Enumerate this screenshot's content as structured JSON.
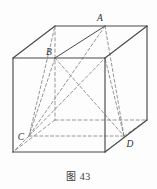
{
  "figure": {
    "caption_label": "图",
    "caption_number": "43",
    "shape": "cube with inscribed tetrahedron",
    "colors": {
      "visible_edge": "#4a4a4a",
      "hidden_edge": "#8d8d8d",
      "label_text": "#2e2e2e",
      "background": "#fdfdfd"
    },
    "vertices": [
      {
        "id": "A",
        "label": "A",
        "x": 105,
        "y": 26,
        "label_x": 101,
        "label_y": 21
      },
      {
        "id": "B",
        "label": "B",
        "x": 55,
        "y": 58,
        "label_x": 50,
        "label_y": 54
      },
      {
        "id": "C",
        "label": "C",
        "x": 29,
        "y": 136,
        "label_x": 20,
        "label_y": 140
      },
      {
        "id": "D",
        "label": "D",
        "x": 124,
        "y": 136,
        "label_x": 127,
        "label_y": 146
      }
    ],
    "cube": {
      "front_face": [
        [
          13,
          58
        ],
        [
          105,
          58
        ],
        [
          105,
          152
        ],
        [
          13,
          152
        ]
      ],
      "back_face": [
        [
          55,
          26
        ],
        [
          147,
          26
        ],
        [
          147,
          120
        ],
        [
          55,
          120
        ]
      ],
      "visible_edges": [
        [
          [
            13,
            58
          ],
          [
            105,
            58
          ]
        ],
        [
          [
            105,
            58
          ],
          [
            105,
            152
          ]
        ],
        [
          [
            105,
            152
          ],
          [
            13,
            152
          ]
        ],
        [
          [
            13,
            152
          ],
          [
            13,
            58
          ]
        ],
        [
          [
            13,
            58
          ],
          [
            55,
            26
          ]
        ],
        [
          [
            55,
            26
          ],
          [
            147,
            26
          ]
        ],
        [
          [
            147,
            26
          ],
          [
            105,
            58
          ]
        ],
        [
          [
            147,
            26
          ],
          [
            147,
            120
          ]
        ],
        [
          [
            147,
            120
          ],
          [
            105,
            152
          ]
        ]
      ],
      "hidden_edges": [
        [
          [
            55,
            26
          ],
          [
            55,
            120
          ]
        ],
        [
          [
            55,
            120
          ],
          [
            147,
            120
          ]
        ],
        [
          [
            55,
            120
          ],
          [
            13,
            152
          ]
        ]
      ]
    },
    "tetrahedron": {
      "name": "ABCD",
      "edges": [
        {
          "from": "A",
          "to": "B",
          "style": "solid"
        },
        {
          "from": "A",
          "to": "C",
          "style": "dashed"
        },
        {
          "from": "A",
          "to": "D",
          "style": "dashed"
        },
        {
          "from": "B",
          "to": "C",
          "style": "dashed"
        },
        {
          "from": "B",
          "to": "D",
          "style": "dashed"
        },
        {
          "from": "C",
          "to": "D",
          "style": "dashed"
        }
      ]
    },
    "construction_lines": [
      {
        "from": [
          29,
          136
        ],
        "to": [
          55,
          26
        ],
        "style": "dashed",
        "note": "C to back-top-left"
      },
      {
        "from": [
          29,
          136
        ],
        "to": [
          105,
          58
        ],
        "style": "dashed",
        "note": "C to front-top-right"
      },
      {
        "from": [
          124,
          136
        ],
        "to": [
          105,
          58
        ],
        "style": "dashed",
        "note": "D to front-top-right"
      },
      {
        "from": [
          124,
          136
        ],
        "to": [
          105,
          26
        ],
        "style": "dashed",
        "note": "D up to A column"
      },
      {
        "from": [
          29,
          136
        ],
        "to": [
          13,
          152
        ],
        "style": "dashed",
        "note": "C to front-bottom-left"
      },
      {
        "from": [
          124,
          136
        ],
        "to": [
          147,
          120
        ],
        "style": "dashed",
        "note": "D to back-bottom-right"
      }
    ]
  }
}
